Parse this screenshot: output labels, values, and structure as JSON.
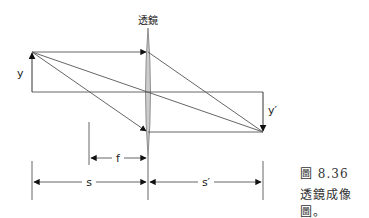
{
  "diagram": {
    "lens_label": "透鏡",
    "object_label": "y",
    "image_label": "y′",
    "focal_label": "f",
    "object_distance_label": "s",
    "image_distance_label": "s′"
  },
  "caption": {
    "figure_number": "圖 8.36",
    "title": "透鏡成像圖。"
  },
  "colors": {
    "line": "#555555",
    "lens_fill": "#cccccc",
    "arrow": "#111111"
  }
}
